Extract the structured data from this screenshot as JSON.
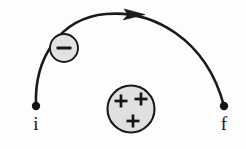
{
  "figure": {
    "type": "physics-diagram",
    "background_color": "#fdfdfd",
    "stroke_color": "#1a1a1a",
    "fill_color": "#e0e0e0"
  },
  "endpoints": {
    "initial": {
      "label": "i",
      "x": 36,
      "y": 106,
      "dot_radius": 4.2
    },
    "final": {
      "label": "f",
      "x": 224,
      "y": 106,
      "dot_radius": 4.2
    }
  },
  "path": {
    "name": "semicircular-arc",
    "start_x": 36,
    "start_y": 106,
    "end_x": 224,
    "end_y": 106,
    "apex_x": 130,
    "apex_y": 13,
    "stroke_width": 2.6
  },
  "arrow": {
    "name": "direction-arrow",
    "tip_x": 143,
    "tip_y": 14,
    "direction": "rightward",
    "size": 9
  },
  "moving_charge": {
    "name": "negative-charge",
    "sign": "−",
    "center_x": 64,
    "center_y": 48,
    "radius": 14,
    "fill": "#e2e2e2",
    "stroke": "#1a1a1a"
  },
  "source_charge": {
    "name": "positive-charge",
    "center_x": 131,
    "center_y": 109,
    "radius": 23.5,
    "fill": "#e0e0e0",
    "stroke": "#1a1a1a",
    "signs": [
      {
        "symbol": "+",
        "x": 121,
        "y": 101
      },
      {
        "symbol": "+",
        "x": 141,
        "y": 99
      },
      {
        "symbol": "+",
        "x": 133,
        "y": 121
      }
    ]
  }
}
